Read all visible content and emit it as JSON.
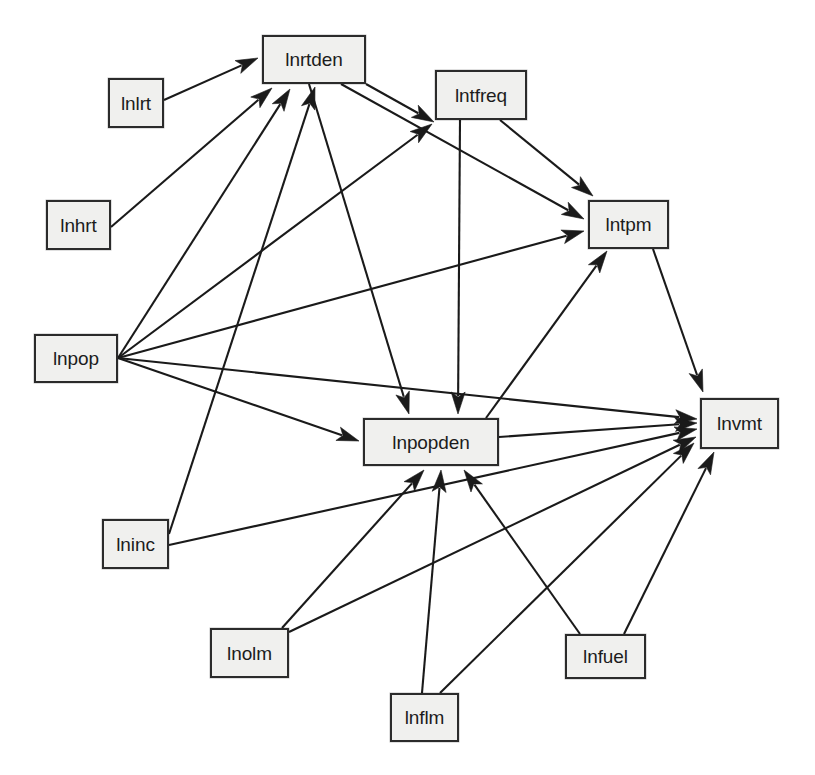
{
  "diagram": {
    "background_color": "#ffffff",
    "node_fill_color": "#f0f0ee",
    "node_border_color": "#2b2b2b",
    "edge_color": "#1a1a1a",
    "nodes": [
      {
        "id": "lnlrt",
        "label": "lnlrt",
        "x": 108,
        "y": 78,
        "w": 56,
        "h": 50
      },
      {
        "id": "lnrtden",
        "label": "lnrtden",
        "x": 262,
        "y": 35,
        "w": 104,
        "h": 49
      },
      {
        "id": "lntfreq",
        "label": "lntfreq",
        "x": 435,
        "y": 70,
        "w": 92,
        "h": 50
      },
      {
        "id": "lnhrt",
        "label": "lnhrt",
        "x": 46,
        "y": 200,
        "w": 65,
        "h": 50
      },
      {
        "id": "lntpm",
        "label": "lntpm",
        "x": 588,
        "y": 200,
        "w": 81,
        "h": 49
      },
      {
        "id": "lnpop",
        "label": "lnpop",
        "x": 34,
        "y": 334,
        "w": 84,
        "h": 49
      },
      {
        "id": "lnvmt",
        "label": "lnvmt",
        "x": 700,
        "y": 398,
        "w": 79,
        "h": 51
      },
      {
        "id": "lnpopden",
        "label": "lnpopden",
        "x": 363,
        "y": 418,
        "w": 136,
        "h": 48
      },
      {
        "id": "lninc",
        "label": "lninc",
        "x": 102,
        "y": 519,
        "w": 67,
        "h": 50
      },
      {
        "id": "lnolm",
        "label": "lnolm",
        "x": 210,
        "y": 628,
        "w": 79,
        "h": 50
      },
      {
        "id": "lnfuel",
        "label": "lnfuel",
        "x": 565,
        "y": 634,
        "w": 81,
        "h": 45
      },
      {
        "id": "lnflm",
        "label": "lnflm",
        "x": 390,
        "y": 693,
        "w": 69,
        "h": 49
      }
    ],
    "edges": [
      {
        "from": "lnlrt",
        "to": "lnrtden",
        "x1": 164,
        "y1": 100,
        "x2": 258,
        "y2": 58
      },
      {
        "from": "lnhrt",
        "to": "lnrtden",
        "x1": 111,
        "y1": 227,
        "x2": 272,
        "y2": 88
      },
      {
        "from": "lnpop",
        "to": "lnrtden",
        "x1": 118,
        "y1": 358,
        "x2": 290,
        "y2": 89
      },
      {
        "from": "lnpop",
        "to": "lntfreq",
        "x1": 118,
        "y1": 358,
        "x2": 432,
        "y2": 124
      },
      {
        "from": "lnpop",
        "to": "lntpm",
        "x1": 118,
        "y1": 358,
        "x2": 584,
        "y2": 231
      },
      {
        "from": "lnpop",
        "to": "lnpopden",
        "x1": 118,
        "y1": 358,
        "x2": 359,
        "y2": 441
      },
      {
        "from": "lnpop",
        "to": "lnvmt",
        "x1": 118,
        "y1": 358,
        "x2": 697,
        "y2": 419
      },
      {
        "from": "lnrtden",
        "to": "lntfreq",
        "x1": 366,
        "y1": 84,
        "x2": 434,
        "y2": 122
      },
      {
        "from": "lnrtden",
        "to": "lntpm",
        "x1": 341,
        "y1": 84,
        "x2": 584,
        "y2": 219
      },
      {
        "from": "lnrtden",
        "to": "lnpopden",
        "x1": 309,
        "y1": 84,
        "x2": 409,
        "y2": 414
      },
      {
        "from": "lntfreq",
        "to": "lntpm",
        "x1": 500,
        "y1": 120,
        "x2": 593,
        "y2": 196
      },
      {
        "from": "lntfreq",
        "to": "lnpopden",
        "x1": 460,
        "y1": 120,
        "x2": 458,
        "y2": 414
      },
      {
        "from": "lntpm",
        "to": "lnvmt",
        "x1": 653,
        "y1": 249,
        "x2": 703,
        "y2": 392
      },
      {
        "from": "lnpopden",
        "to": "lnvmt",
        "x1": 499,
        "y1": 437,
        "x2": 697,
        "y2": 423
      },
      {
        "from": "lnpopden",
        "to": "lntpm",
        "x1": 486,
        "y1": 418,
        "x2": 607,
        "y2": 251
      },
      {
        "from": "lninc",
        "to": "lnrtden",
        "x1": 169,
        "y1": 534,
        "x2": 315,
        "y2": 87
      },
      {
        "from": "lninc",
        "to": "lnvmt",
        "x1": 169,
        "y1": 545,
        "x2": 697,
        "y2": 429
      },
      {
        "from": "lnolm",
        "to": "lnpopden",
        "x1": 282,
        "y1": 628,
        "x2": 424,
        "y2": 470
      },
      {
        "from": "lnolm",
        "to": "lnvmt",
        "x1": 289,
        "y1": 632,
        "x2": 696,
        "y2": 437
      },
      {
        "from": "lnflm",
        "to": "lnpopden",
        "x1": 422,
        "y1": 693,
        "x2": 441,
        "y2": 470
      },
      {
        "from": "lnflm",
        "to": "lnvmt",
        "x1": 440,
        "y1": 693,
        "x2": 694,
        "y2": 443
      },
      {
        "from": "lnfuel",
        "to": "lnpopden",
        "x1": 580,
        "y1": 634,
        "x2": 464,
        "y2": 470
      },
      {
        "from": "lnfuel",
        "to": "lnvmt",
        "x1": 624,
        "y1": 634,
        "x2": 714,
        "y2": 452
      }
    ]
  }
}
